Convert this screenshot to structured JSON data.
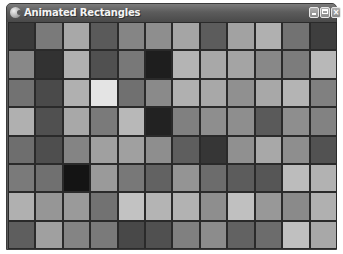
{
  "window": {
    "title": "Animated Rectangles",
    "icon": "app-icon",
    "controls": {
      "minimize": {
        "icon": "minimize-icon",
        "label": "_"
      },
      "maximize": {
        "icon": "maximize-icon",
        "label": "□"
      },
      "close": {
        "icon": "close-icon",
        "label": "×"
      }
    }
  },
  "grid": {
    "columns": 12,
    "rows": 8,
    "cells": [
      [
        "#3a3a3a",
        "#7a7a7a",
        "#a8a8a8",
        "#5a5a5a",
        "#858585",
        "#8e8e8e",
        "#a5a5a5",
        "#5c5c5c",
        "#a2a2a2",
        "#b0b0b0",
        "#727272",
        "#3e3e3e"
      ],
      [
        "#888888",
        "#323232",
        "#b0b0b0",
        "#505050",
        "#787878",
        "#1e1e1e",
        "#b4b4b4",
        "#a8a8a8",
        "#a4a4a4",
        "#888888",
        "#7c7c7c",
        "#b8b8b8"
      ],
      [
        "#727272",
        "#4a4a4a",
        "#b0b0b0",
        "#e4e4e4",
        "#707070",
        "#8a8a8a",
        "#b0b0b0",
        "#a8a8a8",
        "#909090",
        "#a8a8a8",
        "#b4b4b4",
        "#808080"
      ],
      [
        "#b0b0b0",
        "#505050",
        "#a8a8a8",
        "#7a7a7a",
        "#b8b8b8",
        "#222222",
        "#808080",
        "#8e8e8e",
        "#8e8e8e",
        "#5a5a5a",
        "#8e8e8e",
        "#828282"
      ],
      [
        "#6e6e6e",
        "#4e4e4e",
        "#848484",
        "#a0a0a0",
        "#a0a0a0",
        "#8e8e8e",
        "#5e5e5e",
        "#363636",
        "#909090",
        "#a8a8a8",
        "#8e8e8e",
        "#525252"
      ],
      [
        "#7a7a7a",
        "#707070",
        "#141414",
        "#9a9a9a",
        "#787878",
        "#626262",
        "#949494",
        "#6c6c6c",
        "#5c5c5c",
        "#565656",
        "#bcbcbc",
        "#b2b2b2"
      ],
      [
        "#b0b0b0",
        "#969696",
        "#9a9a9a",
        "#727272",
        "#c2c2c2",
        "#b4b4b4",
        "#b2b2b2",
        "#8e8e8e",
        "#c0c0c0",
        "#989898",
        "#8a8a8a",
        "#b0b0b0"
      ],
      [
        "#5e5e5e",
        "#a0a0a0",
        "#848484",
        "#7a7a7a",
        "#484848",
        "#505050",
        "#808080",
        "#8c8c8c",
        "#626262",
        "#6c6c6c",
        "#c0c0c0",
        "#a8a8a8"
      ]
    ]
  }
}
